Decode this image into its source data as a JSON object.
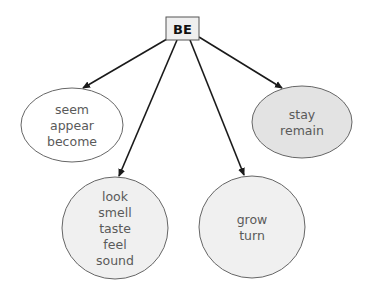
{
  "diagram": {
    "type": "tree",
    "root": {
      "label": "BE",
      "fill": "#efefef"
    },
    "children": [
      {
        "id": "seem-group",
        "words": [
          "seem",
          "appear",
          "become"
        ],
        "fill": "#ffffff"
      },
      {
        "id": "senses-group",
        "words": [
          "look",
          "smell",
          "taste",
          "feel",
          "sound"
        ],
        "fill": "#f0f0f0"
      },
      {
        "id": "change-group",
        "words": [
          "grow",
          "turn"
        ],
        "fill": "#f0f0f0"
      },
      {
        "id": "stay-group",
        "words": [
          "stay",
          "remain"
        ],
        "fill": "#e3e3e3"
      }
    ],
    "edges": [
      {
        "from": "root",
        "to": "seem-group"
      },
      {
        "from": "root",
        "to": "senses-group"
      },
      {
        "from": "root",
        "to": "change-group"
      },
      {
        "from": "root",
        "to": "stay-group"
      }
    ]
  }
}
